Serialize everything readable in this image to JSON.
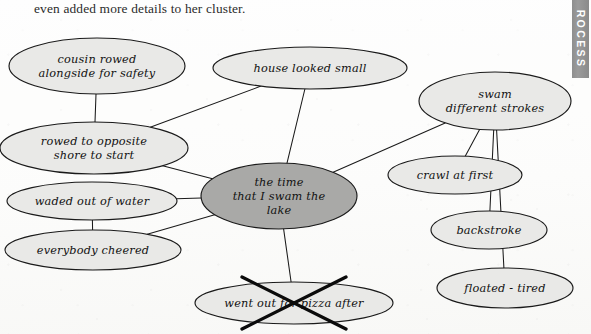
{
  "caption": {
    "text": "even added more details to her cluster."
  },
  "thumb_tab": {
    "label": "ROCESS"
  },
  "diagram": {
    "type": "cluster-web",
    "colors": {
      "page_background": "#fdfdfc",
      "node_fill": "#e9e9e7",
      "center_node_fill": "#a9a9a7",
      "stroke": "#1a1a1a",
      "tab_background": "#909090"
    },
    "center_node": {
      "id": "center",
      "lines": [
        "the time",
        "that I swam the",
        "lake"
      ],
      "text": "the time that I swam the lake",
      "cx": 279,
      "cy": 196,
      "rx": 78,
      "ry": 33,
      "emphasis": "shaded-dark"
    },
    "nodes": [
      {
        "id": "cousin-rowed",
        "lines": [
          "cousin rowed",
          "alongside for safety"
        ],
        "text": "cousin rowed alongside for safety",
        "cx": 97,
        "cy": 66,
        "rx": 88,
        "ry": 28
      },
      {
        "id": "rowed-opposite",
        "lines": [
          "rowed to opposite",
          "shore to start"
        ],
        "text": "rowed to opposite shore to start",
        "cx": 94,
        "cy": 148,
        "rx": 94,
        "ry": 26
      },
      {
        "id": "waded-out",
        "lines": [
          "waded out of water"
        ],
        "text": "waded out of water",
        "cx": 92,
        "cy": 201,
        "rx": 85,
        "ry": 19
      },
      {
        "id": "everybody-cheered",
        "lines": [
          "everybody cheered"
        ],
        "text": "everybody cheered",
        "cx": 93,
        "cy": 250,
        "rx": 88,
        "ry": 20
      },
      {
        "id": "house-looked-small",
        "lines": [
          "house looked small"
        ],
        "text": "house looked small",
        "cx": 310,
        "cy": 68,
        "rx": 97,
        "ry": 21
      },
      {
        "id": "swam-strokes",
        "lines": [
          "swam",
          "different strokes"
        ],
        "text": "swam different strokes",
        "cx": 495,
        "cy": 101,
        "rx": 76,
        "ry": 29
      },
      {
        "id": "crawl-at-first",
        "lines": [
          "crawl at first"
        ],
        "text": "crawl at first",
        "cx": 455,
        "cy": 175,
        "rx": 67,
        "ry": 19
      },
      {
        "id": "backstroke",
        "lines": [
          "backstroke"
        ],
        "text": "backstroke",
        "cx": 489,
        "cy": 230,
        "rx": 58,
        "ry": 19
      },
      {
        "id": "floated-tired",
        "lines": [
          "floated - tired"
        ],
        "text": "floated - tired",
        "cx": 505,
        "cy": 288,
        "rx": 68,
        "ry": 20
      }
    ],
    "crossed_out_node": {
      "id": "pizza-after",
      "lines": [
        "went out for pizza after"
      ],
      "text": "went out for pizza after",
      "cx": 294,
      "cy": 303,
      "rx": 99,
      "ry": 21,
      "struck_through": true,
      "strike_mark": "large-X"
    },
    "connections": [
      {
        "from": "cousin-rowed",
        "to": "rowed-opposite"
      },
      {
        "from": "rowed-opposite",
        "to": "house-looked-small"
      },
      {
        "from": "rowed-opposite",
        "to": "center"
      },
      {
        "from": "waded-out",
        "to": "center"
      },
      {
        "from": "waded-out",
        "to": "everybody-cheered"
      },
      {
        "from": "everybody-cheered",
        "to": "center"
      },
      {
        "from": "house-looked-small",
        "to": "center"
      },
      {
        "from": "swam-strokes",
        "to": "center"
      },
      {
        "from": "swam-strokes",
        "to": "crawl-at-first"
      },
      {
        "from": "swam-strokes",
        "to": "backstroke"
      },
      {
        "from": "swam-strokes",
        "to": "floated-tired"
      },
      {
        "from": "center",
        "to": "pizza-after"
      }
    ]
  }
}
